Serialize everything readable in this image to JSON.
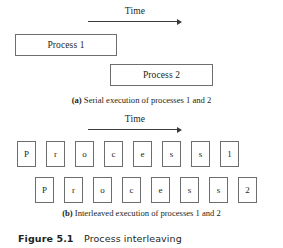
{
  "figure": {
    "number": "Figure 5.1",
    "title": "Process interleaving"
  },
  "colors": {
    "box_border": "#6d6e70",
    "arrow": "#3a3a3c",
    "text": "#231f20",
    "background": "#ffffff"
  },
  "part_a": {
    "time_axis": {
      "label": "Time",
      "icon": "right-arrow-icon"
    },
    "bars": [
      {
        "label": "Process 1"
      },
      {
        "label": "Process 2"
      }
    ],
    "caption": {
      "tag": "(a)",
      "text": " Serial execution of processes 1 and 2"
    }
  },
  "part_b": {
    "time_axis": {
      "label": "Time",
      "icon": "right-arrow-icon"
    },
    "rows": [
      {
        "cells": [
          "P",
          "r",
          "o",
          "c",
          "e",
          "s",
          "s",
          "1"
        ]
      },
      {
        "cells": [
          "P",
          "r",
          "o",
          "c",
          "e",
          "s",
          "s",
          "2"
        ]
      }
    ],
    "caption": {
      "tag": "(b)",
      "text": " Interleaved execution of processes 1 and 2"
    }
  }
}
